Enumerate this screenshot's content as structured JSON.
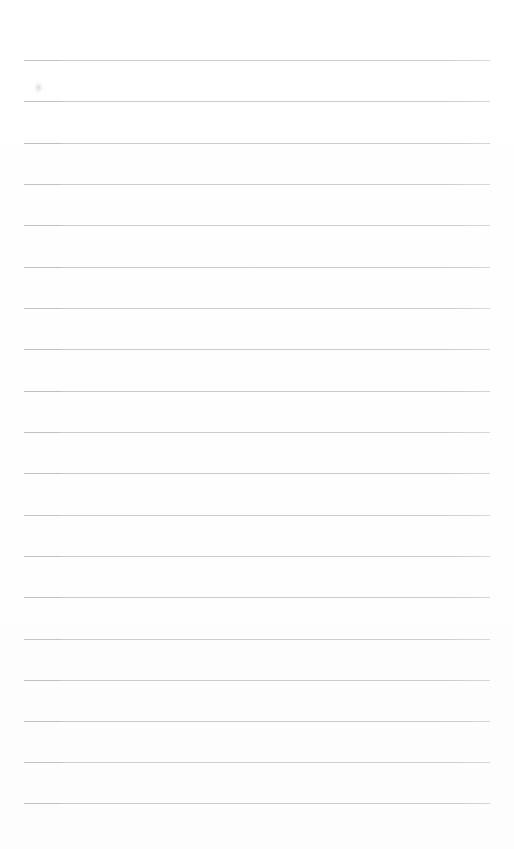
{
  "document": {
    "type": "lined-paper",
    "title": "Blank ruled notebook page",
    "description": "A scanned blank sheet of ruled writing paper with no handwriting or printed text.",
    "page_width": 514,
    "page_height": 849,
    "background_color": "#fefefe",
    "text_content": ""
  },
  "ruling": {
    "line_color": "#c9c9c9",
    "line_color_left_accent": "#bdbdbd",
    "line_thickness": 1,
    "line_count": 19,
    "first_line_y": 60,
    "line_spacing": 41.3,
    "left_margin_x": 24,
    "right_margin_x": 490,
    "line_length": 466,
    "lines_y": [
      60,
      101,
      143,
      184,
      225,
      267,
      308,
      349,
      391,
      432,
      473,
      515,
      556,
      597,
      639,
      680,
      721,
      762,
      803
    ]
  },
  "artifacts": {
    "smudge": {
      "name": "faint-scan-smudge",
      "x": 34,
      "y": 82,
      "width": 9,
      "height": 11,
      "color": "#bebec3"
    }
  }
}
